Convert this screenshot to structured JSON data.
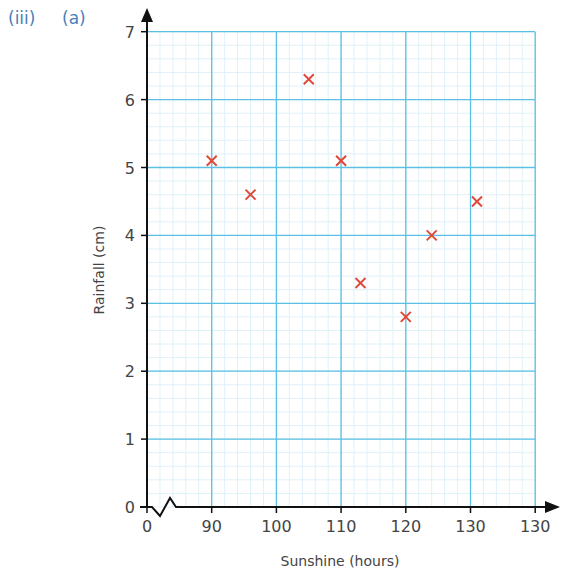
{
  "question": {
    "part_roman": "(iii)",
    "part_letter": "(a)"
  },
  "colors": {
    "major_grid": "#5bc0e3",
    "minor_grid": "#dff1f9",
    "axis": "#111111",
    "marker": "#e0483a",
    "label_accent": "#4a7fb8"
  },
  "chart_data": {
    "type": "scatter",
    "title": "",
    "xlabel": "Sunshine (hours)",
    "ylabel": "Rainfall (cm)",
    "x_tick_labels": [
      "0",
      "90",
      "100",
      "110",
      "120",
      "130",
      "130"
    ],
    "y_tick_labels": [
      "0",
      "1",
      "2",
      "3",
      "4",
      "5",
      "6",
      "7"
    ],
    "xlim": [
      80,
      140
    ],
    "ylim": [
      0,
      7
    ],
    "x_axis_break": true,
    "grid": true,
    "marker": "x",
    "series": [
      {
        "name": "Sunshine vs Rainfall",
        "points": [
          {
            "x": 90,
            "y": 5.1
          },
          {
            "x": 96,
            "y": 4.6
          },
          {
            "x": 105,
            "y": 6.3
          },
          {
            "x": 110,
            "y": 5.1
          },
          {
            "x": 113,
            "y": 3.3
          },
          {
            "x": 120,
            "y": 2.8
          },
          {
            "x": 124,
            "y": 4.0
          },
          {
            "x": 131,
            "y": 4.5
          }
        ]
      }
    ]
  }
}
